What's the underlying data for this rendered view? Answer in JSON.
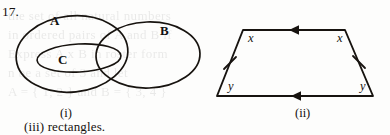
{
  "page": {
    "question_number": "17.",
    "tail_text": "(iii) rectangles.",
    "background_color": "#fdfdfc",
    "ink_color": "#17130f"
  },
  "figures": [
    {
      "id": "venn",
      "caption": "(i)",
      "type": "venn-diagram",
      "sets": [
        {
          "name": "A",
          "role": "outer-left-ellipse"
        },
        {
          "name": "B",
          "role": "outer-right-ellipse"
        },
        {
          "name": "C",
          "role": "inner-ellipse-within-A"
        }
      ]
    },
    {
      "id": "trapezoid",
      "caption": "(ii)",
      "type": "trapezoid",
      "angle_labels": {
        "top_left": "x",
        "top_right": "x",
        "bottom_left": "y",
        "bottom_right": "y"
      },
      "markings": {
        "parallel_arrows": 1,
        "congruent_leg_ticks": 1
      }
    }
  ],
  "bleed_through": {
    "lines": [
      "the set of all natural numbers",
      "in ordered pairs of A and B if",
      "Express A x B in roster form",
      "n be a set of 3 and let",
      "A = { 1, 2 } and B = { 3, 4 }"
    ]
  }
}
